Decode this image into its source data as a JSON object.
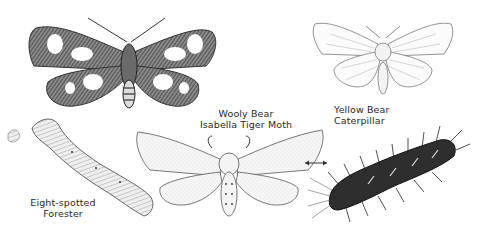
{
  "illustration": {
    "subjects": [
      {
        "id": "eight-spotted-forester-moth",
        "kind": "moth",
        "pattern": "dark wings with white spots"
      },
      {
        "id": "yellow-bear-moth",
        "kind": "moth",
        "pattern": "pale veined wings"
      },
      {
        "id": "isabella-tiger-moth",
        "kind": "moth",
        "pattern": "stippled pale wings"
      },
      {
        "id": "eight-spotted-forester-caterpillar",
        "kind": "caterpillar",
        "pattern": "segmented pale body"
      },
      {
        "id": "wooly-bear-caterpillar",
        "kind": "caterpillar",
        "pattern": "dark bristly body"
      }
    ],
    "labels": {
      "wooly_bear_line1": "Wooly Bear",
      "wooly_bear_line2": "Isabella Tiger Moth",
      "yellow_bear_line1": "Yellow Bear",
      "yellow_bear_line2": "Caterpillar",
      "forester_line1": "Eight-spotted",
      "forester_line2": "Forester"
    },
    "arrow": "double-headed-arrow",
    "colors": {
      "ink": "#2a2a2a",
      "dark_fill": "#4a4a4a",
      "pale_fill": "#f4f4f4",
      "background": "#ffffff"
    }
  }
}
